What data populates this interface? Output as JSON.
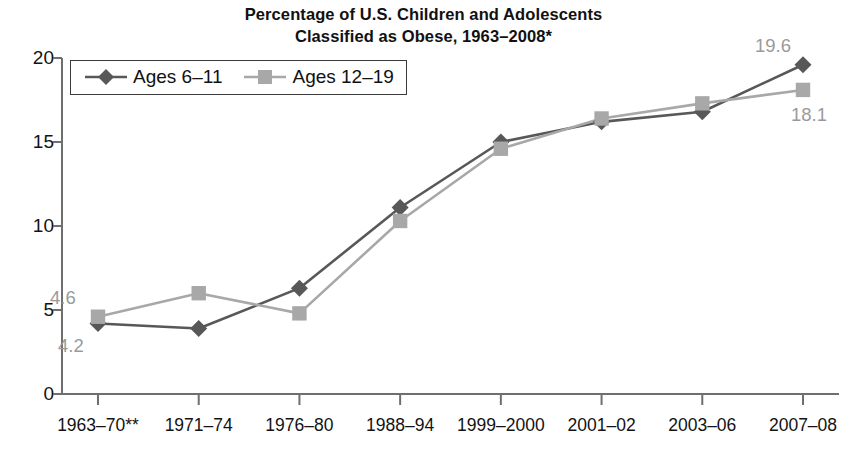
{
  "title": {
    "line1": "Percentage of U.S. Children and Adolescents",
    "line2": "Classified as Obese, 1963–2008*"
  },
  "legend": {
    "items": [
      {
        "label": "Ages 6–11",
        "marker": "diamond",
        "color": "#585858"
      },
      {
        "label": "Ages 12–19",
        "marker": "square",
        "color": "#a8a8a8"
      }
    ]
  },
  "axes": {
    "y_ticks": [
      "0",
      "5",
      "10",
      "15",
      "20"
    ],
    "x_ticks": [
      "1963–70**",
      "1971–74",
      "1976–80",
      "1988–94",
      "1999–2000",
      "2001–02",
      "2003–06",
      "2007–08"
    ]
  },
  "annotations": [
    {
      "text": "4.6",
      "series": "Ages 12–19",
      "point_index": 0,
      "position": "above-left"
    },
    {
      "text": "4.2",
      "series": "Ages 6–11",
      "point_index": 0,
      "position": "below-left"
    },
    {
      "text": "19.6",
      "series": "Ages 6–11",
      "point_index": 7,
      "position": "above-left"
    },
    {
      "text": "18.1",
      "series": "Ages 12–19",
      "point_index": 7,
      "position": "below-right"
    }
  ],
  "chart_data": {
    "type": "line",
    "title": "Percentage of U.S. Children and Adolescents Classified as Obese, 1963–2008*",
    "xlabel": "",
    "ylabel": "",
    "categories": [
      "1963–70**",
      "1971–74",
      "1976–80",
      "1988–94",
      "1999–2000",
      "2001–02",
      "2003–06",
      "2007–08"
    ],
    "series": [
      {
        "name": "Ages 6–11",
        "color": "#585858",
        "marker": "diamond",
        "values": [
          4.2,
          3.9,
          6.3,
          11.1,
          15.0,
          16.2,
          16.8,
          19.6
        ]
      },
      {
        "name": "Ages 12–19",
        "color": "#a8a8a8",
        "marker": "square",
        "values": [
          4.6,
          6.0,
          4.8,
          10.3,
          14.6,
          16.4,
          17.3,
          18.1
        ]
      }
    ],
    "ylim": [
      0,
      20
    ],
    "ytick_step": 5,
    "grid": false,
    "legend_position": "top-left"
  }
}
